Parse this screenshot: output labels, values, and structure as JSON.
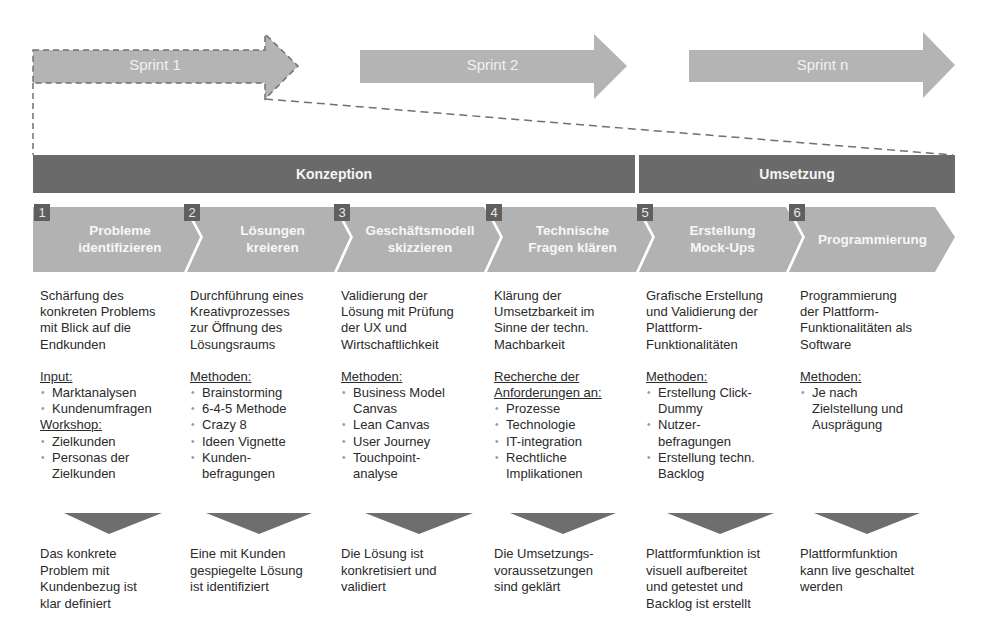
{
  "sprints": [
    {
      "label": "Sprint 1"
    },
    {
      "label": "Sprint 2"
    },
    {
      "label": "Sprint n"
    }
  ],
  "phases": [
    {
      "label": "Konzeption"
    },
    {
      "label": "Umsetzung"
    }
  ],
  "steps": [
    {
      "number": "1",
      "title": "Probleme\nidentifizieren",
      "description": "Schärfung des\nkonkreten Problems\nmit Blick auf die\nEndkunden",
      "sections": [
        {
          "heading": "Input:",
          "items": [
            "Marktanalysen",
            "Kundenumfragen"
          ]
        },
        {
          "heading": "Workshop:",
          "items": [
            "Zielkunden",
            "Personas der\nZielkunden"
          ]
        }
      ],
      "result": "Das konkrete\nProblem mit\nKundenbezug ist\nklar definiert"
    },
    {
      "number": "2",
      "title": "Lösungen\nkreieren",
      "description": "Durchführung eines\nKreativprozesses\nzur Öffnung des\nLösungsraums",
      "sections": [
        {
          "heading": "Methoden:",
          "items": [
            "Brainstorming",
            "6-4-5 Methode",
            "Crazy 8",
            "Ideen Vignette",
            "Kunden-\nbefragungen"
          ]
        }
      ],
      "result": "Eine mit Kunden\ngespiegelte Lösung\nist identifiziert"
    },
    {
      "number": "3",
      "title": "Geschäftsmodell\nskizzieren",
      "description": "Validierung der\nLösung mit Prüfung\nder UX und\nWirtschaftlichkeit",
      "sections": [
        {
          "heading": "Methoden:",
          "items": [
            "Business Model\nCanvas",
            "Lean Canvas",
            "User Journey",
            "Touchpoint-\nanalyse"
          ]
        }
      ],
      "result": "Die Lösung ist\nkonkretisiert und\nvalidiert"
    },
    {
      "number": "4",
      "title": "Technische\nFragen klären",
      "description": "Klärung der\nUmsetzbarkeit im\nSinne der techn.\nMachbarkeit",
      "sections": [
        {
          "heading": "Recherche der\nAnforderungen an:",
          "items": [
            "Prozesse",
            "Technologie",
            "IT-integration",
            "Rechtliche\nImplikationen"
          ]
        }
      ],
      "result": "Die Umsetzungs-\nvoraussetzungen\nsind geklärt"
    },
    {
      "number": "5",
      "title": "Erstellung\nMock-Ups",
      "description": "Grafische Erstellung\nund Validierung der\nPlattform-\nFunktionalitäten",
      "sections": [
        {
          "heading": "Methoden:",
          "items": [
            "Erstellung Click-\nDummy",
            "Nutzer-\nbefragungen",
            "Erstellung techn.\nBacklog"
          ]
        }
      ],
      "result": "Plattformfunktion ist\nvisuell aufbereitet\nund getestet und\nBacklog ist erstellt"
    },
    {
      "number": "6",
      "title": "Programmierung",
      "description": "Programmierung\nder Plattform-\nFunktionalitäten als\nSoftware",
      "sections": [
        {
          "heading": "Methoden:",
          "items": [
            "Je nach\nZielstellung und\nAusprägung"
          ]
        }
      ],
      "result": "Plattformfunktion\nkann live geschaltet\nwerden"
    }
  ],
  "colors": {
    "sprint_arrow": "#b4b4b4",
    "phase_bar": "#6a6a6a",
    "step_chevron": "#b2b2b2",
    "step_number_box": "#5f5f5f",
    "result_arrow": "#6e6e6e",
    "dashed_line": "#707070"
  }
}
